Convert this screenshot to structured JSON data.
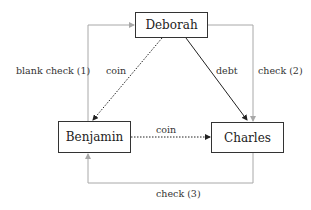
{
  "nodes": {
    "deborah": "Deborah",
    "benjamin": "Benjamin",
    "charles": "Charles"
  },
  "edges": {
    "blank_check": "blank check (1)",
    "coin_deb_ben": "coin",
    "debt": "debt",
    "check2": "check (2)",
    "coin_ben_char": "coin",
    "check3": "check (3)"
  },
  "colors": {
    "gray_line": "#a8a8a8",
    "dark_line": "#222222",
    "box_border": "#333333"
  }
}
